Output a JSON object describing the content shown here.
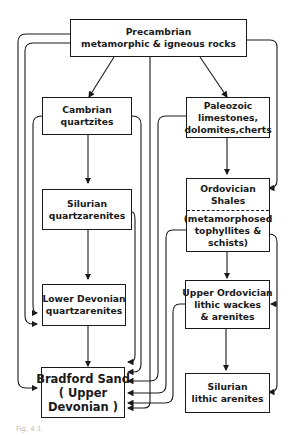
{
  "diagram": {
    "nodes": {
      "precambrian": {
        "lines": [
          "Precambrian",
          "metamorphic & igneous rocks"
        ]
      },
      "cambrian": {
        "lines": [
          "Cambrian",
          "quartzites"
        ]
      },
      "paleozoic": {
        "lines": [
          "Paleozoic",
          "limestones,",
          "dolomites,cherts"
        ]
      },
      "silurian_q": {
        "lines": [
          "Silurian",
          "quartzarenites"
        ]
      },
      "ordovician_shales": {
        "top": [
          "Ordovician",
          "Shales"
        ],
        "bottom": [
          "(metamorphosed",
          "tophyllites &",
          "schists)"
        ]
      },
      "lower_devonian": {
        "lines": [
          "Lower Devonian",
          "quartzarenites"
        ]
      },
      "upper_ordovician": {
        "lines": [
          "Upper Ordovician",
          "lithic wackes",
          "& arenites"
        ]
      },
      "bradford": {
        "lines": [
          "Bradford Sand",
          "( Upper",
          "Devonian )"
        ]
      },
      "silurian_l": {
        "lines": [
          "Silurian",
          "lithic arenites"
        ]
      }
    },
    "edges": [
      [
        "precambrian",
        "cambrian"
      ],
      [
        "precambrian",
        "paleozoic"
      ],
      [
        "precambrian",
        "bradford"
      ],
      [
        "precambrian",
        "lower_devonian"
      ],
      [
        "precambrian",
        "ordovician_shales"
      ],
      [
        "cambrian",
        "silurian_q"
      ],
      [
        "cambrian",
        "lower_devonian"
      ],
      [
        "cambrian",
        "bradford"
      ],
      [
        "paleozoic",
        "ordovician_shales"
      ],
      [
        "paleozoic",
        "bradford"
      ],
      [
        "silurian_q",
        "lower_devonian"
      ],
      [
        "silurian_q",
        "bradford"
      ],
      [
        "ordovician_shales",
        "upper_ordovician"
      ],
      [
        "ordovician_shales",
        "silurian_l"
      ],
      [
        "ordovician_shales",
        "bradford"
      ],
      [
        "lower_devonian",
        "bradford"
      ],
      [
        "upper_ordovician",
        "silurian_l"
      ],
      [
        "upper_ordovician",
        "bradford"
      ]
    ]
  },
  "caption": "Fig. 4.1"
}
